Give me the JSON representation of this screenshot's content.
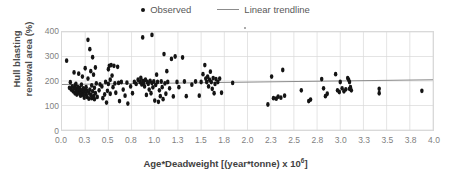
{
  "legend": {
    "position": "top-center",
    "entries": [
      {
        "label": "Observed",
        "marker": "dot",
        "color": "#141414"
      },
      {
        "label": "Linear trendline",
        "marker": "line",
        "color": "#8c8c8c"
      }
    ]
  },
  "axis_titles": {
    "y": "Hull blasting renewal area (%)",
    "y_line1": "Hull blasting",
    "y_line2": "renewal area (%)",
    "x_prefix": "Age*Deadweight [(year*tonne) x 10",
    "x_sup": "6",
    "x_suffix": "]"
  },
  "colors": {
    "marker": "#141414",
    "trendline": "#8c8c8c",
    "gridline": "#d9d9d9",
    "plot_border": "#d9d9d9",
    "tick_text": "#7f7f7f",
    "title_text": "#4d4d4d",
    "background": "#ffffff"
  },
  "chart_data": {
    "type": "scatter",
    "title": "",
    "xlabel": "Age*Deadweight [(year*tonne) x 10^6]",
    "ylabel": "Hull blasting renewal area (%)",
    "xlim": [
      0.0,
      4.0
    ],
    "ylim": [
      0,
      400
    ],
    "grid": true,
    "legend_position": "top-center",
    "xticks": [
      "0.0",
      "0.3",
      "0.5",
      "0.8",
      "1.0",
      "1.3",
      "1.5",
      "1.8",
      "2.0",
      "2.3",
      "2.5",
      "2.8",
      "3.0",
      "3.3",
      "3.5",
      "3.8",
      "4.0"
    ],
    "xtick_values": [
      0.0,
      0.25,
      0.5,
      0.75,
      1.0,
      1.25,
      1.5,
      1.75,
      2.0,
      2.25,
      2.5,
      2.75,
      3.0,
      3.25,
      3.5,
      3.75,
      4.0
    ],
    "yticks": [
      "0",
      "100",
      "200",
      "300",
      "400"
    ],
    "ytick_values": [
      0,
      100,
      200,
      300,
      400
    ],
    "series": [
      {
        "name": "Observed",
        "type": "scatter",
        "marker": "circle",
        "color": "#141414",
        "points": [
          [
            0.05,
            283
          ],
          [
            0.08,
            172
          ],
          [
            0.09,
            195
          ],
          [
            0.1,
            165
          ],
          [
            0.11,
            178
          ],
          [
            0.12,
            158
          ],
          [
            0.13,
            235
          ],
          [
            0.13,
            170
          ],
          [
            0.14,
            150
          ],
          [
            0.14,
            182
          ],
          [
            0.15,
            168
          ],
          [
            0.15,
            188
          ],
          [
            0.16,
            162
          ],
          [
            0.16,
            145
          ],
          [
            0.17,
            175
          ],
          [
            0.17,
            155
          ],
          [
            0.18,
            230
          ],
          [
            0.18,
            166
          ],
          [
            0.19,
            148
          ],
          [
            0.19,
            172
          ],
          [
            0.2,
            160
          ],
          [
            0.2,
            140
          ],
          [
            0.21,
            185
          ],
          [
            0.21,
            152
          ],
          [
            0.22,
            218
          ],
          [
            0.22,
            163
          ],
          [
            0.23,
            143
          ],
          [
            0.23,
            170
          ],
          [
            0.24,
            157
          ],
          [
            0.24,
            132
          ],
          [
            0.25,
            252
          ],
          [
            0.25,
            168
          ],
          [
            0.26,
            146
          ],
          [
            0.26,
            175
          ],
          [
            0.27,
            160
          ],
          [
            0.27,
            135
          ],
          [
            0.28,
            368
          ],
          [
            0.28,
            210
          ],
          [
            0.29,
            152
          ],
          [
            0.29,
            128
          ],
          [
            0.3,
            330
          ],
          [
            0.3,
            165
          ],
          [
            0.31,
            240
          ],
          [
            0.31,
            143
          ],
          [
            0.32,
            182
          ],
          [
            0.32,
            130
          ],
          [
            0.33,
            297
          ],
          [
            0.33,
            158
          ],
          [
            0.34,
            226
          ],
          [
            0.34,
            138
          ],
          [
            0.35,
            172
          ],
          [
            0.35,
            126
          ],
          [
            0.36,
            255
          ],
          [
            0.36,
            150
          ],
          [
            0.37,
            190
          ],
          [
            0.38,
            135
          ],
          [
            0.4,
            162
          ],
          [
            0.41,
            186
          ],
          [
            0.43,
            178
          ],
          [
            0.44,
            130
          ],
          [
            0.46,
            145
          ],
          [
            0.47,
            196
          ],
          [
            0.48,
            112
          ],
          [
            0.49,
            160
          ],
          [
            0.5,
            248
          ],
          [
            0.5,
            188
          ],
          [
            0.51,
            262
          ],
          [
            0.52,
            205
          ],
          [
            0.52,
            148
          ],
          [
            0.53,
            265
          ],
          [
            0.54,
            222
          ],
          [
            0.55,
            175
          ],
          [
            0.56,
            262
          ],
          [
            0.57,
            190
          ],
          [
            0.58,
            152
          ],
          [
            0.6,
            258
          ],
          [
            0.61,
            192
          ],
          [
            0.62,
            118
          ],
          [
            0.64,
            196
          ],
          [
            0.66,
            165
          ],
          [
            0.68,
            140
          ],
          [
            0.7,
            193
          ],
          [
            0.71,
            108
          ],
          [
            0.74,
            178
          ],
          [
            0.76,
            150
          ],
          [
            0.78,
            196
          ],
          [
            0.8,
            188
          ],
          [
            0.82,
            205
          ],
          [
            0.84,
            196
          ],
          [
            0.85,
            213
          ],
          [
            0.86,
            186
          ],
          [
            0.87,
            378
          ],
          [
            0.87,
            200
          ],
          [
            0.88,
            192
          ],
          [
            0.89,
            178
          ],
          [
            0.9,
            205
          ],
          [
            0.91,
            143
          ],
          [
            0.92,
            196
          ],
          [
            0.93,
            188
          ],
          [
            0.94,
            165
          ],
          [
            0.95,
            200
          ],
          [
            0.96,
            150
          ],
          [
            0.97,
            388
          ],
          [
            0.97,
            192
          ],
          [
            0.98,
            174
          ],
          [
            0.99,
            198
          ],
          [
            1.0,
            120
          ],
          [
            1.01,
            184
          ],
          [
            1.02,
            226
          ],
          [
            1.03,
            196
          ],
          [
            1.04,
            115
          ],
          [
            1.05,
            162
          ],
          [
            1.06,
            138
          ],
          [
            1.07,
            198
          ],
          [
            1.08,
            175
          ],
          [
            1.09,
            126
          ],
          [
            1.1,
            310
          ],
          [
            1.11,
            190
          ],
          [
            1.12,
            148
          ],
          [
            1.13,
            240
          ],
          [
            1.14,
            196
          ],
          [
            1.16,
            170
          ],
          [
            1.18,
            290
          ],
          [
            1.2,
            137
          ],
          [
            1.22,
            300
          ],
          [
            1.24,
            196
          ],
          [
            1.26,
            175
          ],
          [
            1.3,
            296
          ],
          [
            1.32,
            198
          ],
          [
            1.34,
            138
          ],
          [
            1.4,
            185
          ],
          [
            1.44,
            198
          ],
          [
            1.48,
            140
          ],
          [
            1.5,
            196
          ],
          [
            1.52,
            228
          ],
          [
            1.54,
            265
          ],
          [
            1.55,
            210
          ],
          [
            1.56,
            196
          ],
          [
            1.57,
            218
          ],
          [
            1.58,
            178
          ],
          [
            1.59,
            205
          ],
          [
            1.6,
            238
          ],
          [
            1.61,
            196
          ],
          [
            1.62,
            168
          ],
          [
            1.63,
            212
          ],
          [
            1.64,
            150
          ],
          [
            1.65,
            188
          ],
          [
            1.66,
            208
          ],
          [
            1.68,
            196
          ],
          [
            1.7,
            210
          ],
          [
            1.72,
            152
          ],
          [
            1.84,
            192
          ],
          [
            2.22,
            104
          ],
          [
            2.26,
            218
          ],
          [
            2.28,
            130
          ],
          [
            2.31,
            128
          ],
          [
            2.33,
            136
          ],
          [
            2.36,
            132
          ],
          [
            2.38,
            245
          ],
          [
            2.4,
            140
          ],
          [
            2.58,
            162
          ],
          [
            2.66,
            118
          ],
          [
            2.68,
            124
          ],
          [
            2.8,
            208
          ],
          [
            2.82,
            170
          ],
          [
            2.84,
            138
          ],
          [
            2.86,
            148
          ],
          [
            2.95,
            228
          ],
          [
            2.97,
            162
          ],
          [
            2.99,
            155
          ],
          [
            3.0,
            196
          ],
          [
            3.02,
            170
          ],
          [
            3.04,
            158
          ],
          [
            3.06,
            166
          ],
          [
            3.08,
            212
          ],
          [
            3.09,
            205
          ],
          [
            3.1,
            196
          ],
          [
            3.1,
            168
          ],
          [
            3.11,
            175
          ],
          [
            3.12,
            162
          ],
          [
            3.42,
            168
          ],
          [
            3.42,
            150
          ],
          [
            3.88,
            160
          ]
        ]
      },
      {
        "name": "Linear trendline",
        "type": "line",
        "color": "#8c8c8c",
        "x": [
          0.0,
          4.0
        ],
        "y": [
          186,
          205
        ],
        "equation_slope": 4.75,
        "equation_intercept": 186
      }
    ]
  }
}
